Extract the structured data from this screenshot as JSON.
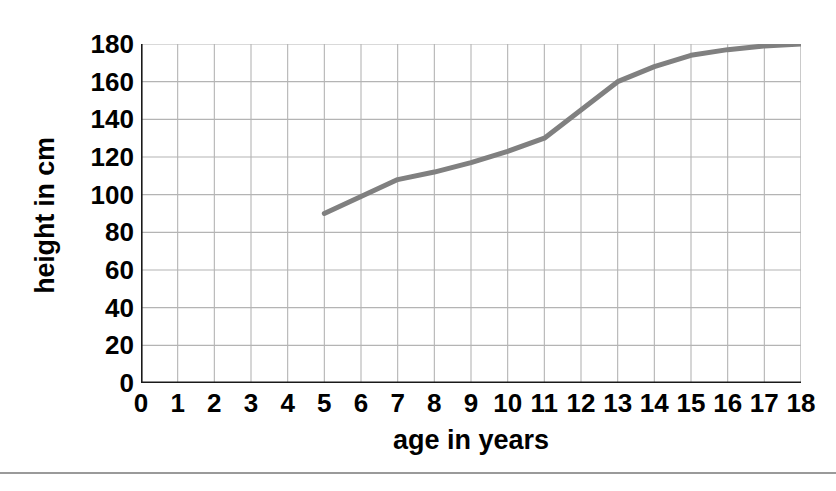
{
  "chart_data": {
    "type": "line",
    "title": "",
    "xlabel": "age in years",
    "ylabel": "height in cm",
    "xlim": [
      0,
      18
    ],
    "ylim": [
      0,
      180
    ],
    "xticks": [
      0,
      1,
      2,
      3,
      4,
      5,
      6,
      7,
      8,
      9,
      10,
      11,
      12,
      13,
      14,
      15,
      16,
      17,
      18
    ],
    "yticks": [
      0,
      20,
      40,
      60,
      80,
      100,
      120,
      140,
      160,
      180
    ],
    "xtick_labels": [
      "0",
      "1",
      "2",
      "3",
      "4",
      "5",
      "6",
      "7",
      "8",
      "9",
      "10",
      "11",
      "12",
      "13",
      "14",
      "15",
      "16",
      "17",
      "18"
    ],
    "ytick_labels": [
      "0",
      "20",
      "40",
      "60",
      "80",
      "100",
      "120",
      "140",
      "160",
      "180"
    ],
    "grid": true,
    "legend": false,
    "series": [
      {
        "name": "height",
        "color": "#808080",
        "line_width": 5,
        "x": [
          5,
          6,
          7,
          8,
          9,
          10,
          11,
          12,
          13,
          14,
          15,
          16,
          17,
          18
        ],
        "values": [
          90,
          99,
          108,
          112,
          117,
          123,
          130,
          145,
          160,
          168,
          174,
          177,
          179,
          180
        ]
      }
    ],
    "grid_color": "#b4b4b4",
    "axis_color": "#1a1a1a",
    "background": "#ffffff"
  },
  "footer": {
    "rule_color": "#9a9a9a"
  }
}
